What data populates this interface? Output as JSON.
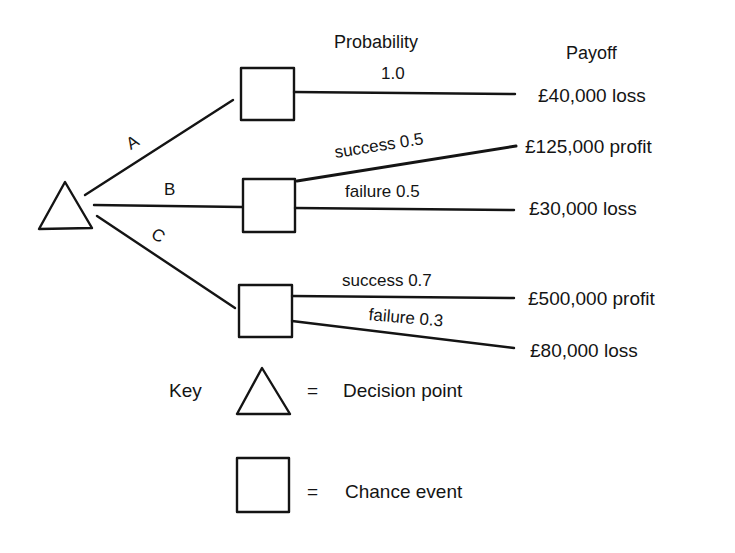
{
  "headers": {
    "probability": "Probability",
    "payoff": "Payoff"
  },
  "decision_node": {
    "shape": "triangle",
    "meaning": "Decision point"
  },
  "branches": [
    {
      "label": "A",
      "outcomes": [
        {
          "name": "",
          "probability": "1.0",
          "payoff": "£40,000 loss"
        }
      ]
    },
    {
      "label": "B",
      "outcomes": [
        {
          "name": "success",
          "probability": "0.5",
          "label": "success 0.5",
          "payoff": "£125,000 profit"
        },
        {
          "name": "failure",
          "probability": "0.5",
          "label": "failure 0.5",
          "payoff": "£30,000 loss"
        }
      ]
    },
    {
      "label": "C",
      "outcomes": [
        {
          "name": "success",
          "probability": "0.7",
          "label": "success 0.7",
          "payoff": "£500,000 profit"
        },
        {
          "name": "failure",
          "probability": "0.3",
          "label": "failure 0.3",
          "payoff": "£80,000 loss"
        }
      ]
    }
  ],
  "key": {
    "title": "Key",
    "items": [
      {
        "symbol": "triangle",
        "equals": "=",
        "label": "Decision point"
      },
      {
        "symbol": "square",
        "equals": "=",
        "label": "Chance event"
      }
    ]
  },
  "colors": {
    "ink": "#141414",
    "background": "#ffffff"
  }
}
